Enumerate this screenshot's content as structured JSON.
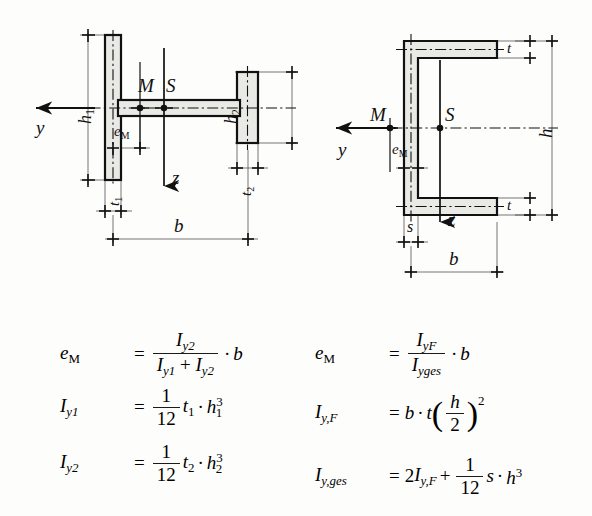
{
  "document": {
    "title": "Shear centre of thin-walled open cross-sections",
    "background_color": "#fdfdfb",
    "ink_color": "#1b1b1b",
    "section_fill_color": "#e8e8e4"
  },
  "figures": [
    {
      "id": "tee-section",
      "name": "unequal-flange-tee-section",
      "caption": "",
      "labels": {
        "y_axis": "y",
        "z_axis": "z",
        "shear_centre": "M",
        "centroid": "S",
        "eccentricity": "e",
        "eccentricity_sub": "M",
        "left_flange_height": "h",
        "left_flange_height_sub": "1",
        "left_flange_thickness": "t",
        "left_flange_thickness_sub": "1",
        "right_flange_height": "h",
        "right_flange_height_sub": "2",
        "right_flange_thickness": "t",
        "right_flange_thickness_sub": "2",
        "width": "b"
      }
    },
    {
      "id": "channel-section",
      "name": "channel-section",
      "caption": "",
      "labels": {
        "y_axis": "y",
        "z_axis": "z",
        "shear_centre": "M",
        "centroid": "S",
        "eccentricity": "e",
        "eccentricity_sub": "M",
        "flange_thickness": "t",
        "web_thickness": "s",
        "height": "h",
        "width": "b"
      }
    }
  ],
  "formulas": {
    "left": [
      {
        "id": "tee-eM",
        "lhs_symbol": "e",
        "lhs_sub": "M",
        "relation": "=",
        "numerator_symbol": "I",
        "numerator_sub": "y2",
        "denominator": "I_y1 + I_y2",
        "multiplier": "b",
        "plain": "e_M = I_y2 / (I_y1 + I_y2) · b"
      },
      {
        "id": "tee-Iy1",
        "lhs_symbol": "I",
        "lhs_sub": "y1",
        "relation": "=",
        "fraction_num": "1",
        "fraction_den": "12",
        "term1": "t",
        "term1_sub": "1",
        "term2": "h",
        "term2_sub": "1",
        "term2_exp": "3",
        "plain": "I_y1 = (1/12) t_1 · h_1^3"
      },
      {
        "id": "tee-Iy2",
        "lhs_symbol": "I",
        "lhs_sub": "y2",
        "relation": "=",
        "fraction_num": "1",
        "fraction_den": "12",
        "term1": "t",
        "term1_sub": "2",
        "term2": "h",
        "term2_sub": "2",
        "term2_exp": "3",
        "plain": "I_y2 = (1/12) t_2 · h_2^3"
      }
    ],
    "right": [
      {
        "id": "channel-eM",
        "lhs_symbol": "e",
        "lhs_sub": "M",
        "relation": "=",
        "numerator_symbol": "I",
        "numerator_sub": "yF",
        "denominator_symbol": "I",
        "denominator_sub": "yges",
        "multiplier": "b",
        "plain": "e_M = I_yF / I_yges · b"
      },
      {
        "id": "channel-IyF",
        "lhs_symbol": "I",
        "lhs_sub": "y,F",
        "relation": "=",
        "term1": "b",
        "term2": "t",
        "fraction_num": "h",
        "fraction_den": "2",
        "exponent": "2",
        "plain": "I_y,F = b · t (h/2)^2"
      },
      {
        "id": "channel-Iyges",
        "lhs_symbol": "I",
        "lhs_sub": "y,ges",
        "relation": "=",
        "coefficient": "2",
        "term1": "I",
        "term1_sub": "y,F",
        "operator": "+",
        "fraction_num": "1",
        "fraction_den": "12",
        "term2": "s",
        "term3": "h",
        "term3_exp": "3",
        "plain": "I_y,ges = 2 I_y,F + (1/12) s · h^3"
      }
    ]
  },
  "symbols": {
    "dot_operator": "·",
    "plus": "+",
    "equals": "="
  }
}
